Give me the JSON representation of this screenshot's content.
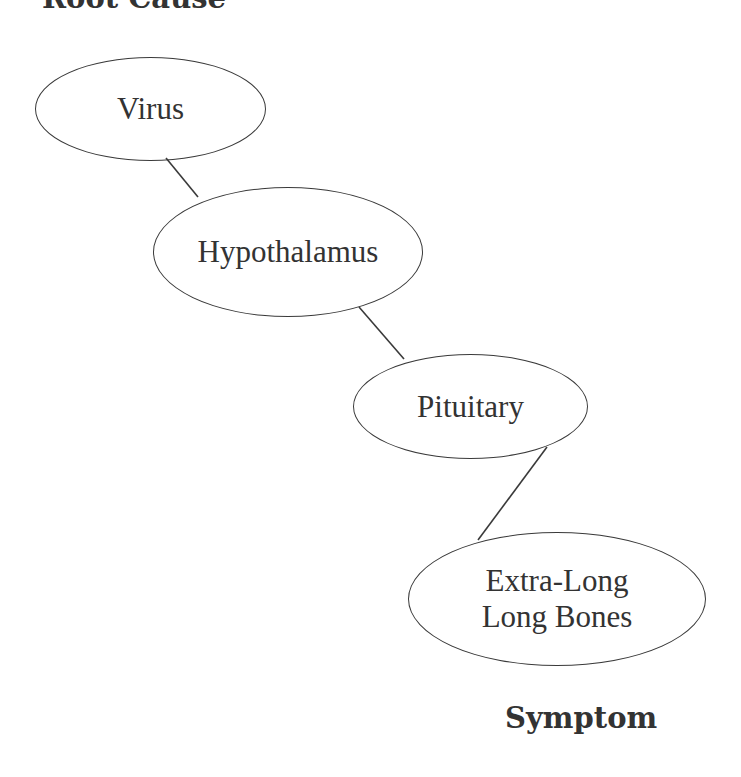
{
  "diagram": {
    "type": "causal-chain",
    "title_top": "Root Cause",
    "title_bottom": "Symptom",
    "nodes": [
      {
        "id": "virus",
        "label": "Virus"
      },
      {
        "id": "hypothalamus",
        "label": "Hypothalamus"
      },
      {
        "id": "pituitary",
        "label": "Pituitary"
      },
      {
        "id": "bones",
        "label_line1": "Extra-Long",
        "label_line2": "Long Bones"
      }
    ],
    "edges": [
      {
        "from": "virus",
        "to": "hypothalamus"
      },
      {
        "from": "hypothalamus",
        "to": "pituitary"
      },
      {
        "from": "pituitary",
        "to": "bones"
      }
    ],
    "colors": {
      "stroke": "#3a3a3a",
      "text": "#333333",
      "background": "#ffffff"
    }
  }
}
